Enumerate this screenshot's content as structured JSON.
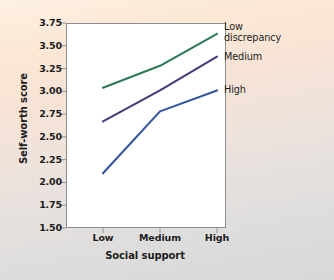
{
  "chart_data": {
    "type": "line",
    "title": "",
    "xlabel": "Social support",
    "ylabel": "Self-worth score",
    "categories": [
      "Low",
      "Medium",
      "High"
    ],
    "ylim": [
      1.5,
      3.75
    ],
    "yticks": [
      "1.50",
      "1.75",
      "2.00",
      "2.25",
      "2.50",
      "2.75",
      "3.00",
      "3.25",
      "3.50",
      "3.75"
    ],
    "ytick_values": [
      1.5,
      1.75,
      2.0,
      2.25,
      2.5,
      2.75,
      3.0,
      3.25,
      3.5,
      3.75
    ],
    "grid": false,
    "legend_position": "inline-right",
    "series": [
      {
        "name": "Low discrepancy",
        "label_text": "Low\ndiscrepancy",
        "color": "#2a7a55",
        "values": [
          3.04,
          3.28,
          3.63
        ]
      },
      {
        "name": "Medium",
        "label_text": "Medium",
        "color": "#4a3a7a",
        "values": [
          2.67,
          3.01,
          3.38
        ]
      },
      {
        "name": "High",
        "label_text": "High",
        "color": "#3355a0",
        "values": [
          2.1,
          2.78,
          3.01
        ]
      }
    ]
  },
  "axis": {
    "y_title": "Self-worth score",
    "x_title": "Social support",
    "y_ticks": [
      {
        "text": "3.75"
      },
      {
        "text": "3.50"
      },
      {
        "text": "3.25"
      },
      {
        "text": "3.00"
      },
      {
        "text": "2.75"
      },
      {
        "text": "2.50"
      },
      {
        "text": "2.25"
      },
      {
        "text": "2.00"
      },
      {
        "text": "1.75"
      },
      {
        "text": "1.50"
      }
    ],
    "x_ticks": [
      {
        "text": "Low"
      },
      {
        "text": "Medium"
      },
      {
        "text": "High"
      }
    ]
  },
  "series_labels": [
    {
      "text": "Low\ndiscrepancy"
    },
    {
      "text": "Medium"
    },
    {
      "text": "High"
    }
  ],
  "colors": {
    "low_discrepancy": "#2a7a55",
    "medium": "#4a3a7a",
    "high": "#3355a0",
    "plot_background": "#ffffff",
    "axis": "#8e8e8e",
    "text": "#1d1d1d"
  }
}
